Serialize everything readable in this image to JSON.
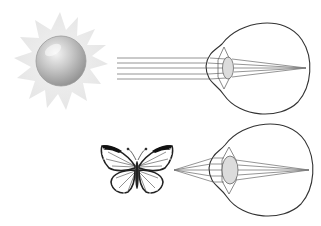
{
  "diagram": {
    "title": "Eye accommodation: distant vs near object",
    "panels": [
      {
        "id": "distant",
        "object": "sun-icon",
        "object_label": "Distant object (sun)",
        "rays": "parallel",
        "ray_count": 5,
        "lens_shape": "thin",
        "focus": "retina"
      },
      {
        "id": "near",
        "object": "butterfly-icon",
        "object_label": "Near object (butterfly)",
        "rays": "diverging",
        "ray_count": 5,
        "lens_shape": "thick",
        "focus": "retina"
      }
    ]
  },
  "colors": {
    "background": "#ffffff",
    "outline": "#333333",
    "ray": "#777777",
    "lens_fill": "#d8d8d8",
    "sun_glow": "#ececec",
    "sun_core": "#bdbdbd"
  }
}
